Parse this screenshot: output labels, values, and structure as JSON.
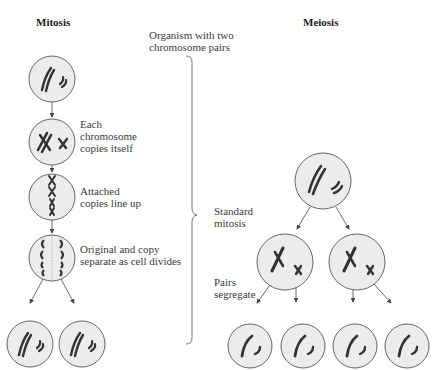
{
  "titles": {
    "mitosis": "Mitosis",
    "meiosis": "Meiosis"
  },
  "labels": {
    "organism": "Organism with two\nchromosome pairs",
    "each_copies": "Each\nchromosome\ncopies itself",
    "line_up": "Attached\ncopies line up",
    "separate": "Original and copy\nseparate as cell divides",
    "standard_mitosis": "Standard\nmitosis",
    "pairs_segregate": "Pairs\nsegregate"
  },
  "colors": {
    "cell_fill": "#ececec",
    "cell_stroke": "#555555",
    "chromosome": "#333333",
    "arrow": "#444444"
  },
  "mitosis_steps": [
    {
      "stage": "parent",
      "label_key": "organism"
    },
    {
      "stage": "duplicated",
      "label_key": "each_copies"
    },
    {
      "stage": "metaphase",
      "label_key": "line_up"
    },
    {
      "stage": "anaphase",
      "label_key": "separate"
    },
    {
      "stage": "daughters",
      "count": 2
    }
  ],
  "meiosis_steps": [
    {
      "stage": "parent",
      "count": 1
    },
    {
      "stage": "after_mitosis",
      "count": 2,
      "label_key": "standard_mitosis"
    },
    {
      "stage": "after_segregation",
      "count": 4,
      "label_key": "pairs_segregate"
    }
  ]
}
